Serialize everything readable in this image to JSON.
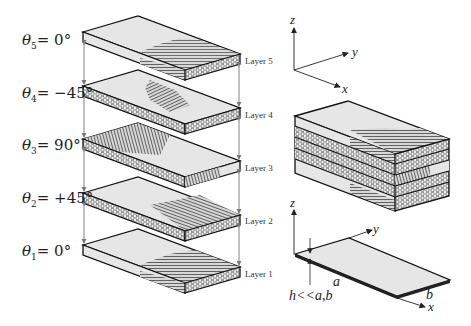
{
  "figure": {
    "plies": [
      {
        "layer_label": "Layer 5",
        "theta_symbol": "θ",
        "index": "5",
        "angle": "= 0°",
        "fiber_orientation": "0"
      },
      {
        "layer_label": "Layer 4",
        "theta_symbol": "θ",
        "index": "4",
        "angle": "= −45°",
        "fiber_orientation": "-45"
      },
      {
        "layer_label": "Layer 3",
        "theta_symbol": "θ",
        "index": "3",
        "angle": "= 90°",
        "fiber_orientation": "90"
      },
      {
        "layer_label": "Layer 2",
        "theta_symbol": "θ",
        "index": "2",
        "angle": "= +45°",
        "fiber_orientation": "+45"
      },
      {
        "layer_label": "Layer 1",
        "theta_symbol": "θ",
        "index": "1",
        "angle": "= 0°",
        "fiber_orientation": "0"
      }
    ],
    "axes_top": {
      "z": "z",
      "y": "y",
      "x": "x"
    },
    "axes_plate": {
      "z": "z",
      "y": "y",
      "x": "x"
    },
    "plate": {
      "thickness_label": "h<<a,b",
      "length_label": "a",
      "width_label": "b"
    },
    "colors": {
      "face": "#e6e6e6",
      "hatch": "#555555",
      "edge": "#111111",
      "arrow": "#777777"
    }
  }
}
